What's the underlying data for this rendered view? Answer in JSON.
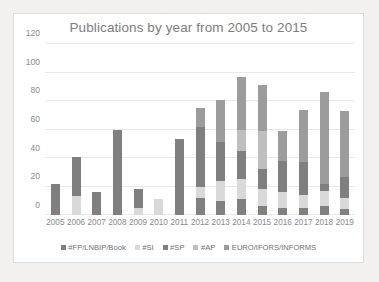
{
  "chart_data": {
    "type": "bar",
    "stacked": true,
    "title": "Publications by year from 2005 to 2015",
    "xlabel": "",
    "ylabel": "",
    "ylim": [
      0,
      120
    ],
    "yticks": [
      0,
      20,
      40,
      60,
      80,
      100,
      120
    ],
    "grid": true,
    "legend_position": "bottom",
    "categories": [
      "2005",
      "2006",
      "2007",
      "2008",
      "2009",
      "2010",
      "2011",
      "2012",
      "2013",
      "2014",
      "2015",
      "2016",
      "2017",
      "2018",
      "2019"
    ],
    "series": [
      {
        "name": "#FP/LNBIP/Book",
        "color": "#808080",
        "values": [
          0,
          0,
          0,
          0,
          0,
          0,
          0,
          12,
          10,
          11,
          6,
          5,
          5,
          6,
          4
        ]
      },
      {
        "name": "#SI",
        "color": "#d9d9d9",
        "values": [
          0,
          13,
          0,
          0,
          5,
          11,
          0,
          8,
          14,
          14,
          12,
          11,
          9,
          11,
          8
        ]
      },
      {
        "name": "#SP",
        "color": "#7f7f7f",
        "values": [
          22,
          28,
          16,
          60,
          13,
          0,
          53,
          42,
          27,
          20,
          14,
          22,
          23,
          5,
          15
        ]
      },
      {
        "name": "#AP",
        "color": "#bfbfbf",
        "values": [
          0,
          0,
          0,
          0,
          0,
          0,
          0,
          0,
          0,
          15,
          27,
          0,
          0,
          0,
          0
        ]
      },
      {
        "name": "EURO/IFORS/INFORMS",
        "color": "#9c9c9c",
        "values": [
          0,
          0,
          0,
          0,
          0,
          0,
          0,
          13,
          30,
          37,
          32,
          21,
          37,
          64,
          46
        ]
      }
    ],
    "totals": [
      22,
      41,
      16,
      60,
      18,
      11,
      53,
      75,
      81,
      97,
      91,
      59,
      74,
      86,
      73
    ]
  }
}
